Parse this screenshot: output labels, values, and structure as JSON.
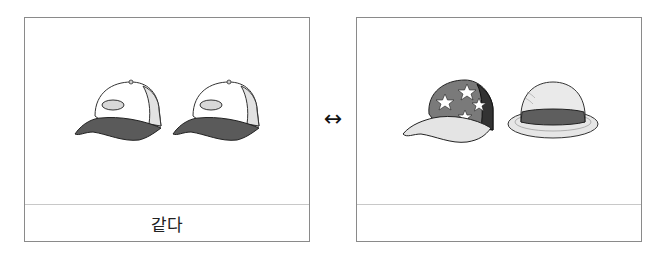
{
  "cards": [
    {
      "id": "left",
      "items": [
        {
          "icon": "baseball-cap-icon",
          "description": "white cap with dark gray brim"
        },
        {
          "icon": "baseball-cap-icon",
          "description": "white cap with dark gray brim"
        }
      ],
      "caption": "같다"
    },
    {
      "id": "right",
      "items": [
        {
          "icon": "star-cap-icon",
          "description": "cap with star pattern and light brim"
        },
        {
          "icon": "bowler-hat-icon",
          "description": "round hat with dark band"
        }
      ],
      "caption": ""
    }
  ],
  "connector": {
    "symbol": "↔",
    "icon": "double-arrow-icon"
  },
  "colors": {
    "border": "#8a8a8a",
    "divider": "#c8c8c8",
    "cap_dark": "#555555",
    "cap_light": "#e6e6e6",
    "cap_mid": "#7a7a7a",
    "cap_darkest": "#333333"
  }
}
